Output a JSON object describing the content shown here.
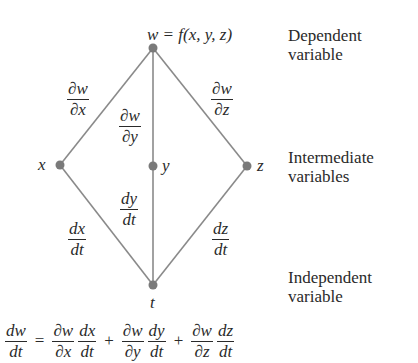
{
  "diagram": {
    "type": "tree",
    "colors": {
      "line": "#8a8a8a",
      "node": "#7a7a7a",
      "text": "#2a2a2a"
    },
    "nodes": [
      {
        "id": "w",
        "label": "w = f(x, y, z)",
        "x": 153,
        "y": 48
      },
      {
        "id": "x",
        "label": "x",
        "x": 60,
        "y": 165
      },
      {
        "id": "y",
        "label": "y",
        "x": 153,
        "y": 166
      },
      {
        "id": "z",
        "label": "z",
        "x": 247,
        "y": 166
      },
      {
        "id": "t",
        "label": "t",
        "x": 153,
        "y": 285
      }
    ],
    "edges": [
      {
        "from": "w",
        "to": "x",
        "num": "∂w",
        "den": "∂x"
      },
      {
        "from": "w",
        "to": "y",
        "num": "∂w",
        "den": "∂y"
      },
      {
        "from": "w",
        "to": "z",
        "num": "∂w",
        "den": "∂z"
      },
      {
        "from": "x",
        "to": "t",
        "num": "dx",
        "den": "dt"
      },
      {
        "from": "y",
        "to": "t",
        "num": "dy",
        "den": "dt"
      },
      {
        "from": "z",
        "to": "t",
        "num": "dz",
        "den": "dt"
      }
    ],
    "levels": [
      {
        "line1": "Dependent",
        "line2": "variable"
      },
      {
        "line1": "Intermediate",
        "line2": "variables"
      },
      {
        "line1": "Independent",
        "line2": "variable"
      }
    ],
    "equation": {
      "lhs": {
        "num": "dw",
        "den": "dt"
      },
      "equals": "=",
      "plus": "+",
      "terms": [
        {
          "a": {
            "num": "∂w",
            "den": "∂x"
          },
          "b": {
            "num": "dx",
            "den": "dt"
          }
        },
        {
          "a": {
            "num": "∂w",
            "den": "∂y"
          },
          "b": {
            "num": "dy",
            "den": "dt"
          }
        },
        {
          "a": {
            "num": "∂w",
            "den": "∂z"
          },
          "b": {
            "num": "dz",
            "den": "dt"
          }
        }
      ]
    }
  }
}
